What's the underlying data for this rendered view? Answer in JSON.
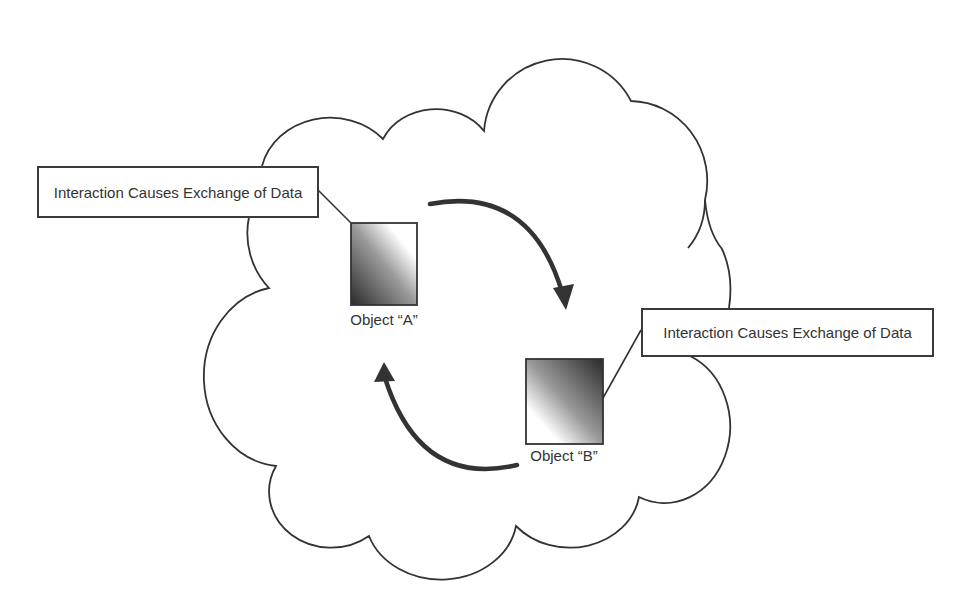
{
  "diagram": {
    "callouts": [
      {
        "label": "Interaction Causes Exchange of Data"
      },
      {
        "label": "Interaction Causes Exchange of Data"
      }
    ],
    "objects": [
      {
        "label": "Object “A”",
        "gradient": "dark-bottom-left"
      },
      {
        "label": "Object “B”",
        "gradient": "dark-top-right"
      }
    ],
    "arrows": [
      {
        "from": "Object A",
        "to": "Object B",
        "direction": "clockwise-top"
      },
      {
        "from": "Object B",
        "to": "Object A",
        "direction": "clockwise-bottom"
      }
    ],
    "container": {
      "shape": "cloud"
    },
    "colors": {
      "stroke": "#333333",
      "arrow": "#333333",
      "background": "#ffffff",
      "gradient_dark": "#2a2a2a",
      "gradient_light": "#ffffff"
    }
  }
}
